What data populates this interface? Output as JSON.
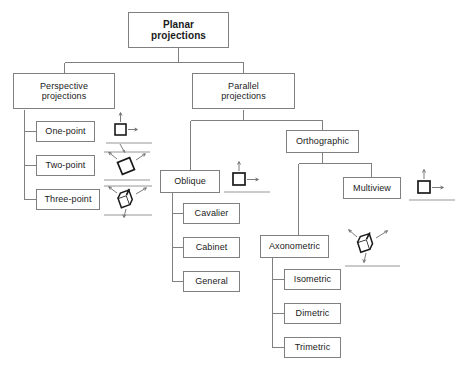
{
  "diagram": {
    "type": "tree-hierarchy",
    "background_color": "#ffffff",
    "box_border_color": "#808080",
    "connector_color": "#808080",
    "text_color": "#1a1a1a"
  },
  "nodes": {
    "root": {
      "label_line1": "Planar",
      "label_line2": "projections"
    },
    "perspective": {
      "label_line1": "Perspective",
      "label_line2": "projections"
    },
    "parallel": {
      "label_line1": "Parallel",
      "label_line2": "projections"
    },
    "one_point": {
      "label": "One-point"
    },
    "two_point": {
      "label": "Two-point"
    },
    "three_point": {
      "label": "Three-point"
    },
    "oblique": {
      "label": "Oblique"
    },
    "cavalier": {
      "label": "Cavalier"
    },
    "cabinet": {
      "label": "Cabinet"
    },
    "general": {
      "label": "General"
    },
    "orthographic": {
      "label": "Orthographic"
    },
    "multiview": {
      "label": "Multiview"
    },
    "axonometric": {
      "label": "Axonometric"
    },
    "isometric": {
      "label": "Isometric"
    },
    "dimetric": {
      "label": "Dimetric"
    },
    "trimetric": {
      "label": "Trimetric"
    }
  },
  "icons": {
    "one_point": {
      "name": "one-point-cube-icon",
      "description": "square with up and right arrows above a horizon line with one vanishing arrow"
    },
    "two_point": {
      "name": "two-point-cube-icon",
      "description": "tilted square between horizon lines with two vanishing arrows"
    },
    "three_point": {
      "name": "three-point-cube-icon",
      "description": "3D cube between horizon lines with three vanishing arrows"
    },
    "oblique": {
      "name": "oblique-cube-icon",
      "description": "square with up and right arrows above a horizon line"
    },
    "multiview": {
      "name": "multiview-cube-icon",
      "description": "square with up and right arrows above a horizon line"
    },
    "axonometric": {
      "name": "axonometric-cube-icon",
      "description": "3D cube with three arrows above a horizon line"
    }
  }
}
